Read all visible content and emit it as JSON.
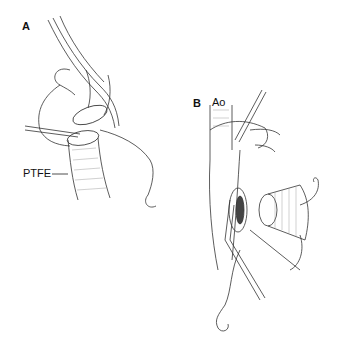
{
  "figure": {
    "panels": [
      {
        "id": "A",
        "label": "A"
      },
      {
        "id": "B",
        "label": "B"
      }
    ],
    "annotations": {
      "ptfe": "PTFE",
      "aorta": "Ao"
    }
  }
}
